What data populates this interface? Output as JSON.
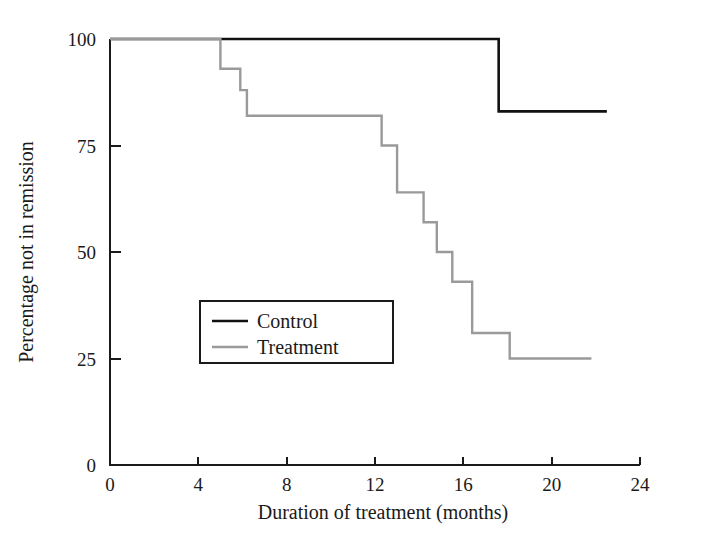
{
  "chart_data": {
    "type": "line",
    "subtype": "kaplan-meier-step",
    "title": "",
    "xlabel": "Duration of treatment (months)",
    "ylabel": "Percentage not in remission",
    "xlim": [
      0,
      24
    ],
    "ylim": [
      0,
      100
    ],
    "xticks": [
      0,
      4,
      8,
      12,
      16,
      20,
      24
    ],
    "xtick_labels": [
      "0",
      "4",
      "8",
      "12",
      "16",
      "20",
      "24"
    ],
    "yticks": [
      0,
      25,
      50,
      75,
      100
    ],
    "ytick_labels": [
      "0",
      "25",
      "50",
      "75",
      "100"
    ],
    "grid": false,
    "legend_position": "center-left",
    "series": [
      {
        "name": "Control",
        "color": "#111111",
        "line_width": 2.6,
        "steps": [
          {
            "x": 0.0,
            "y": 100
          },
          {
            "x": 17.6,
            "y": 100
          },
          {
            "x": 17.6,
            "y": 83
          },
          {
            "x": 22.5,
            "y": 83
          }
        ]
      },
      {
        "name": "Treatment",
        "color": "#9a9a9a",
        "line_width": 2.4,
        "steps": [
          {
            "x": 0.0,
            "y": 100
          },
          {
            "x": 5.0,
            "y": 100
          },
          {
            "x": 5.0,
            "y": 93
          },
          {
            "x": 5.9,
            "y": 93
          },
          {
            "x": 5.9,
            "y": 88
          },
          {
            "x": 6.2,
            "y": 88
          },
          {
            "x": 6.2,
            "y": 82
          },
          {
            "x": 12.3,
            "y": 82
          },
          {
            "x": 12.3,
            "y": 75
          },
          {
            "x": 13.0,
            "y": 75
          },
          {
            "x": 13.0,
            "y": 64
          },
          {
            "x": 14.2,
            "y": 64
          },
          {
            "x": 14.2,
            "y": 57
          },
          {
            "x": 14.8,
            "y": 57
          },
          {
            "x": 14.8,
            "y": 50
          },
          {
            "x": 15.5,
            "y": 50
          },
          {
            "x": 15.5,
            "y": 43
          },
          {
            "x": 16.4,
            "y": 43
          },
          {
            "x": 16.4,
            "y": 31
          },
          {
            "x": 18.1,
            "y": 31
          },
          {
            "x": 18.1,
            "y": 25
          },
          {
            "x": 21.8,
            "y": 25
          }
        ]
      }
    ]
  },
  "legend": {
    "entries": [
      {
        "label": "Control"
      },
      {
        "label": "Treatment"
      }
    ]
  },
  "axes": {
    "x_title": "Duration of treatment (months)",
    "y_title": "Percentage not in remission"
  }
}
